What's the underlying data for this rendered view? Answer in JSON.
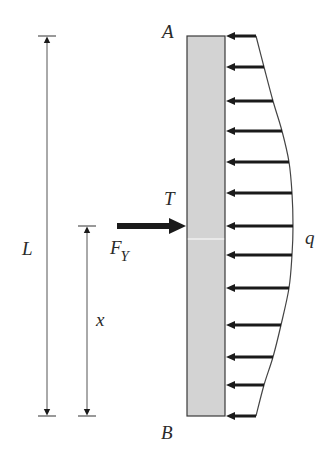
{
  "diagram": {
    "type": "structural-beam-loading",
    "labels": {
      "top_end": "A",
      "bottom_end": "B",
      "torque_point": "T",
      "distributed_load": "q",
      "length": "L",
      "position": "x",
      "force_main": "F",
      "force_sub": "Y"
    },
    "colors": {
      "bar_fill": "#d3d3d3",
      "bar_stroke": "#3a3a3a",
      "arrow": "#1a1a1a",
      "dimension_line": "#555555",
      "text": "#2a2a2a"
    },
    "bar": {
      "x": 187,
      "y": 36,
      "width": 38,
      "height": 380,
      "split_y": 239
    },
    "dimension_L": {
      "x": 47,
      "y_top": 36,
      "y_bottom": 416
    },
    "dimension_x": {
      "x": 87,
      "y_top": 226,
      "y_bottom": 416
    },
    "force_arrow": {
      "x_start": 117,
      "x_end": 186,
      "y": 226
    },
    "load_arrows": [
      {
        "y": 36,
        "tail_x": 256
      },
      {
        "y": 67,
        "tail_x": 264
      },
      {
        "y": 101,
        "tail_x": 273
      },
      {
        "y": 131,
        "tail_x": 282
      },
      {
        "y": 162,
        "tail_x": 289
      },
      {
        "y": 193,
        "tail_x": 292
      },
      {
        "y": 226,
        "tail_x": 293
      },
      {
        "y": 255,
        "tail_x": 292
      },
      {
        "y": 288,
        "tail_x": 289
      },
      {
        "y": 325,
        "tail_x": 281
      },
      {
        "y": 357,
        "tail_x": 273
      },
      {
        "y": 385,
        "tail_x": 264
      },
      {
        "y": 416,
        "tail_x": 256
      }
    ]
  }
}
